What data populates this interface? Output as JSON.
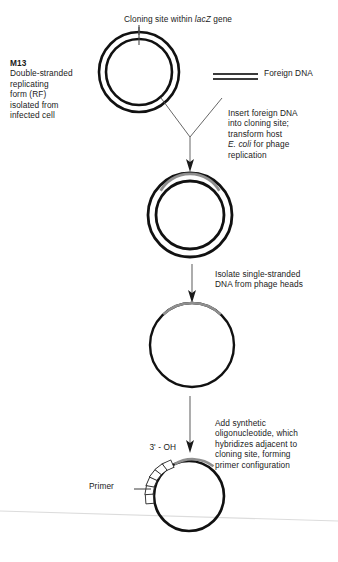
{
  "figure": {
    "background_color": "#ffffff",
    "ink_color": "#111111",
    "insert_arc_color": "#8a8a8a",
    "arrow_color": "#7d7d7d",
    "scan_line_color": "#d8d8d8"
  },
  "labels": {
    "cloning_site": {
      "prefix": "Cloning site within ",
      "italic": "lacZ",
      "suffix": " gene"
    },
    "m13": {
      "heading": "M13",
      "body": "Double-stranded\nreplicating\nform (RF)\nisolated from\ninfected cell"
    },
    "foreign_dna": "Foreign DNA",
    "insert_step": {
      "line1": "Insert foreign DNA",
      "line2": "into cloning site;",
      "line3": "transform host",
      "italic": "E. coli",
      "line4": " for phage",
      "line5": "replication"
    },
    "isolate_step": "Isolate single-stranded\nDNA from phage heads",
    "add_oligo_step": "Add synthetic\noligonucleotide, which\nhybridizes adjacent to\ncloning site, forming\nprimer configuration",
    "three_prime_oh": "3' - OH",
    "primer": "Primer"
  },
  "stages": [
    {
      "name": "double-stranded-rf-circle",
      "kind": "double-circle",
      "cx": 139,
      "cy": 72,
      "outer_r": 40,
      "inner_r": 33,
      "has_insert_arc": false,
      "tick_at_top": true
    },
    {
      "name": "recombinant-rf-circle",
      "kind": "double-circle",
      "cx": 190,
      "cy": 215,
      "outer_r": 42,
      "inner_r": 34,
      "has_insert_arc": true,
      "tick_at_top": false
    },
    {
      "name": "single-stranded-circle",
      "kind": "single-circle",
      "cx": 192,
      "cy": 345,
      "outer_r": 42,
      "has_insert_arc": true,
      "tick_at_top": false
    },
    {
      "name": "primed-template-circle",
      "kind": "single-circle-with-primer",
      "cx": 189,
      "cy": 496,
      "outer_r": 35,
      "has_insert_arc": true,
      "primer_segments": 6
    }
  ],
  "connectors": [
    {
      "name": "cloning-site-leader",
      "kind": "line"
    },
    {
      "name": "foreign-dna-join-arrow",
      "kind": "y-arrow"
    },
    {
      "name": "isolate-arrow",
      "kind": "down-arrow"
    },
    {
      "name": "add-oligo-arrow",
      "kind": "down-arrow"
    }
  ],
  "icons": {
    "foreign_dna_strand": "double-line-dna-icon"
  }
}
